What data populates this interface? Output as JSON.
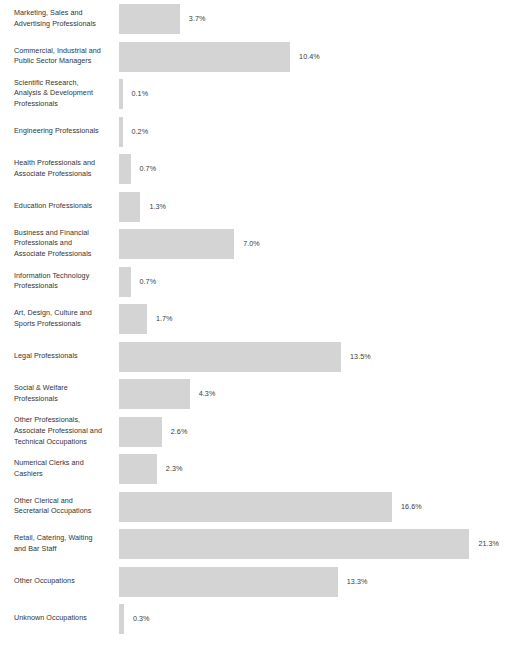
{
  "chart_data": {
    "type": "bar",
    "orientation": "horizontal",
    "title": "",
    "subtitle": "",
    "xlabel": "",
    "ylabel": "",
    "grid": false,
    "legend": null,
    "value_suffix": "%",
    "xlim": [
      0,
      21.3
    ],
    "bar_color": "#d4d4d4",
    "label_color": "#333333",
    "background": "#ffffff",
    "categories": [
      "Marketing, Sales and Advertising Professionals",
      "Commercial, Industrial and Public Sector Managers",
      "Scientific Research, Analysis & Development Professionals",
      "Engineering Professionals",
      "Health Professionals and Associate Professionals",
      "Education Professionals",
      "Business and Financial Professionals and Associate Professionals",
      "Information Technology Professionals",
      "Art, Design, Culture and Sports Professionals",
      "Legal Professionals",
      "Social & Welfare Professionals",
      "Other Professionals, Associate Professional and Technical Occupations",
      "Numerical Clerks and Cashiers",
      "Other Clerical and Secretarial Occupations",
      "Retail, Catering, Waiting and Bar Staff",
      "Other Occupations",
      "Unknown Occupations"
    ],
    "values": [
      3.7,
      10.4,
      0.1,
      0.2,
      0.7,
      1.3,
      7.0,
      0.7,
      1.7,
      13.5,
      4.3,
      2.6,
      2.3,
      16.6,
      21.3,
      13.3,
      0.3
    ],
    "value_labels": [
      "3.7%",
      "10.4%",
      "0.1%",
      "0.2%",
      "0.7%",
      "1.3%",
      "7.0%",
      "0.7%",
      "1.7%",
      "13.5%",
      "4.3%",
      "2.6%",
      "2.3%",
      "16.6%",
      "21.3%",
      "13.3%",
      "0.3%"
    ]
  },
  "rows": [
    {
      "label": "Marketing, Sales and\nAdvertising Professionals",
      "value": "3.7%"
    },
    {
      "label": "Commercial, Industrial and\nPublic Sector Managers",
      "value": "10.4%"
    },
    {
      "label": "Scientific Research,\nAnalysis & Development\nProfessionals",
      "value": "0.1%"
    },
    {
      "label": "Engineering Professionals",
      "value": "0.2%"
    },
    {
      "label": "Health Professionals and\nAssociate Professionals",
      "value": "0.7%"
    },
    {
      "label": "Education Professionals",
      "value": "1.3%"
    },
    {
      "label": "Business and Financial\nProfessionals and\nAssociate Professionals",
      "value": "7.0%"
    },
    {
      "label": "Information Technology\nProfessionals",
      "value": "0.7%"
    },
    {
      "label": "Art, Design, Culture and\nSports Professionals",
      "value": "1.7%"
    },
    {
      "label": "Legal Professionals",
      "value": "13.5%"
    },
    {
      "label": "Social & Welfare\nProfessionals",
      "value": "4.3%"
    },
    {
      "label": "Other Professionals,\nAssociate Professional and\nTechnical Occupations",
      "value": "2.6%"
    },
    {
      "label": "Numerical Clerks and\nCashiers",
      "value": "2.3%"
    },
    {
      "label": "Other Clerical and\nSecretarial Occupations",
      "value": "16.6%"
    },
    {
      "label": "Retail, Catering, Waiting\nand Bar Staff",
      "value": "21.3%"
    },
    {
      "label": "Other Occupations",
      "value": "13.3%"
    },
    {
      "label": "Unknown Occupations",
      "value": "0.3%"
    }
  ]
}
